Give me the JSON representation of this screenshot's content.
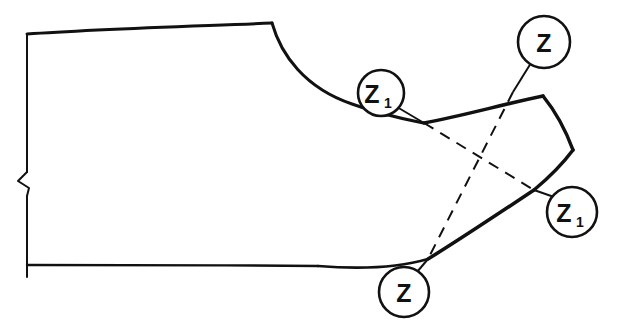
{
  "figure": {
    "name": "pattern-draft-dart-rotation",
    "background_color": "#ffffff",
    "line_color": "#111111",
    "width": 625,
    "height": 336
  },
  "labels": [
    {
      "id": "z1-upper",
      "base": "Z",
      "subscript": "1",
      "circle_cx": 381,
      "circle_cy": 93,
      "circle_r": 23,
      "text_x": 372,
      "text_y": 103,
      "sub_x": 388,
      "sub_y": 108,
      "leader_x1": 397,
      "leader_y1": 107,
      "leader_x2": 424,
      "leader_y2": 123
    },
    {
      "id": "z-upper-right",
      "base": "Z",
      "subscript": "",
      "circle_cx": 544,
      "circle_cy": 42,
      "circle_r": 26,
      "text_x": 535,
      "text_y": 52,
      "sub_x": 0,
      "sub_y": 0,
      "leader_x1": 531,
      "leader_y1": 63,
      "leader_x2": 513,
      "leader_y2": 92
    },
    {
      "id": "z1-lower-right",
      "base": "Z",
      "subscript": "1",
      "circle_cx": 572,
      "circle_cy": 212,
      "circle_r": 25,
      "text_x": 562,
      "text_y": 222,
      "sub_x": 579,
      "sub_y": 227,
      "leader_x1": 554,
      "leader_y1": 197,
      "leader_x2": 534,
      "leader_y2": 190
    },
    {
      "id": "z-lower",
      "base": "Z",
      "subscript": "",
      "circle_cx": 404,
      "circle_cy": 292,
      "circle_r": 25,
      "text_x": 395,
      "text_y": 302,
      "sub_x": 0,
      "sub_y": 0,
      "leader_x1": 417,
      "leader_y1": 272,
      "leader_x2": 428,
      "leader_y2": 259
    }
  ],
  "geometry": {
    "left_edge_upper": "M27,34 L27,172",
    "left_edge_notch": "M27,172 L18,181 L29,188 L27,196",
    "left_edge_lower": "M27,196 L27,277",
    "top_edge": "M27,34 C95,29 200,26 272,23",
    "neck_curve": "M272,23 C281,55 305,88 352,104 C382,115 404,119 424,123",
    "upper_flap": "M424,123 C462,116 504,104 543,96",
    "flap_right_upper": "M543,96 C556,112 566,131 573,150",
    "flap_right_lower": "M573,150 C561,166 546,180 534,190",
    "lower_flap": "M534,190 C492,218 456,242 428,259",
    "bottom_curve": "M428,259 C397,268 355,269 318,266",
    "bottom_edge": "M318,266 C220,265 110,265 27,265",
    "dash_z1": "M424,123 L534,190",
    "dash_z": "M513,92 L428,259"
  }
}
